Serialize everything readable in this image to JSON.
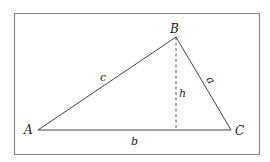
{
  "diagram": {
    "type": "triangle-with-altitude",
    "frame": {
      "x": 14,
      "y": 13,
      "width": 245,
      "height": 141,
      "stroke": "#888888"
    },
    "vertices": [
      {
        "id": "A",
        "label": "A",
        "x": 38,
        "y": 130
      },
      {
        "id": "B",
        "label": "B",
        "x": 176,
        "y": 37
      },
      {
        "id": "C",
        "label": "C",
        "x": 231,
        "y": 130
      }
    ],
    "sides": [
      {
        "id": "a",
        "label": "a",
        "from": "B",
        "to": "C"
      },
      {
        "id": "b",
        "label": "b",
        "from": "A",
        "to": "C"
      },
      {
        "id": "c",
        "label": "c",
        "from": "A",
        "to": "B"
      }
    ],
    "altitude": {
      "label": "h",
      "from": "B",
      "foot_x": 176,
      "foot_y": 130,
      "style": "dashed"
    },
    "colors": {
      "line": "#444444",
      "text": "#222222",
      "frame": "#888888"
    }
  }
}
